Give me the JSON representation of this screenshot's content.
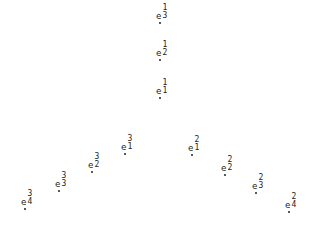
{
  "diagram": {
    "symbol": "e",
    "nodes": [
      {
        "id": "e1_3",
        "base": "e",
        "sup": "1",
        "sub": "3",
        "x": 160,
        "y": 23
      },
      {
        "id": "e1_2",
        "base": "e",
        "sup": "1",
        "sub": "2",
        "x": 160,
        "y": 60
      },
      {
        "id": "e1_1",
        "base": "e",
        "sup": "1",
        "sub": "1",
        "x": 160,
        "y": 98
      },
      {
        "id": "e3_1",
        "base": "e",
        "sup": "3",
        "sub": "1",
        "x": 125,
        "y": 154
      },
      {
        "id": "e3_2",
        "base": "e",
        "sup": "3",
        "sub": "2",
        "x": 92,
        "y": 172
      },
      {
        "id": "e3_3",
        "base": "e",
        "sup": "3",
        "sub": "3",
        "x": 59,
        "y": 191
      },
      {
        "id": "e3_4",
        "base": "e",
        "sup": "3",
        "sub": "4",
        "x": 25,
        "y": 209
      },
      {
        "id": "e2_1",
        "base": "e",
        "sup": "2",
        "sub": "1",
        "x": 192,
        "y": 155
      },
      {
        "id": "e2_2",
        "base": "e",
        "sup": "2",
        "sub": "2",
        "x": 225,
        "y": 175
      },
      {
        "id": "e2_3",
        "base": "e",
        "sup": "2",
        "sub": "3",
        "x": 256,
        "y": 193
      },
      {
        "id": "e2_4",
        "base": "e",
        "sup": "2",
        "sub": "4",
        "x": 289,
        "y": 212
      }
    ]
  }
}
